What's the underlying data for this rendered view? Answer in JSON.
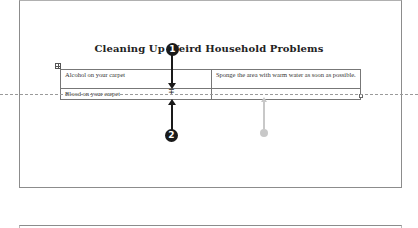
{
  "document": {
    "title": "Cleaning Up Weird Household Problems",
    "table": {
      "rows": [
        [
          "Alcohol on your carpet",
          "Sponge the area with warm water as soon as possible."
        ],
        [
          "Blood on your carpet",
          ""
        ]
      ]
    }
  },
  "callouts": [
    {
      "number": "1",
      "label": "drag row border"
    },
    {
      "number": "2",
      "label": "row resize cursor"
    }
  ],
  "icons": {
    "move_handle": "four-way-move-icon",
    "resize_handle": "table-resize-icon",
    "row_resize_cursor": "row-resize-cursor-icon"
  },
  "cursor_glyph": "∓"
}
